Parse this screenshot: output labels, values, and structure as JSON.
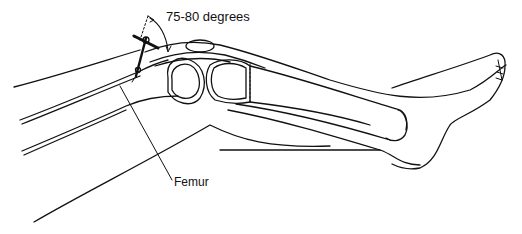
{
  "figure": {
    "labels": {
      "angle": "75-80 degrees",
      "femur": "Femur"
    },
    "colors": {
      "line": "#111111",
      "background": "#ffffff"
    }
  }
}
